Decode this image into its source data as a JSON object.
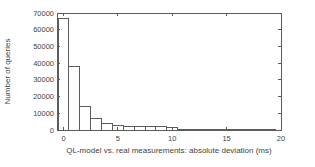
{
  "figure": {
    "background": "#ffffff",
    "line_color": "#5c5c5c",
    "text_color": "#3f3f3f",
    "bar_fill": "#ffffff"
  },
  "chart_data": {
    "type": "bar",
    "subtype": "histogram",
    "title": "",
    "xlabel": "QL-model vs. real measurements: absolute deviation (ms)",
    "ylabel": "Number of queries",
    "xlim": [
      -0.6,
      20
    ],
    "ylim": [
      0,
      70000
    ],
    "x_ticks": [
      0,
      5,
      10,
      15,
      20
    ],
    "y_ticks": [
      0,
      10000,
      20000,
      30000,
      40000,
      50000,
      60000,
      70000
    ],
    "grid": false,
    "legend": "none",
    "bar_width_ms": 1,
    "bin_centers": [
      0,
      1,
      2,
      3,
      4,
      5,
      6,
      7,
      8,
      9,
      10,
      11,
      12,
      13,
      14,
      15,
      16,
      17,
      18,
      19
    ],
    "values": [
      67000,
      38000,
      14000,
      7000,
      4000,
      2500,
      2000,
      1900,
      2000,
      1800,
      1400,
      500,
      300,
      200,
      150,
      120,
      100,
      80,
      60,
      50
    ]
  },
  "plot_geometry": {
    "left": 57,
    "right": 281,
    "top": 13,
    "bottom": 130,
    "tick_len": 3
  }
}
